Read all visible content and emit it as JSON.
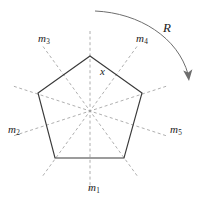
{
  "figure": {
    "shape": {
      "name": "regular-pentagon",
      "sides": 5,
      "center": {
        "x": 90,
        "y": 111
      },
      "circumradius": 55,
      "vertices": [
        {
          "x": 90,
          "y": 56
        },
        {
          "x": 142,
          "y": 93
        },
        {
          "x": 124,
          "y": 158
        },
        {
          "x": 55,
          "y": 158
        },
        {
          "x": 38,
          "y": 93
        }
      ],
      "edge_color": "#3a3a3a"
    },
    "center_label": {
      "text": "x",
      "x": 102,
      "y": 71
    },
    "mirror_line_color": "#9a9a9a",
    "mirror_lines": [
      {
        "id": "m1",
        "label": "m",
        "subscript": "1",
        "angle_deg": 90,
        "label_x": 89,
        "label_y": 186
      },
      {
        "id": "m2",
        "label": "m",
        "subscript": "2",
        "angle_deg": 162,
        "label_x": 9,
        "label_y": 128
      },
      {
        "id": "m3",
        "label": "m",
        "subscript": "3",
        "angle_deg": 234,
        "label_x": 38,
        "label_y": 37
      },
      {
        "id": "m4",
        "label": "m",
        "subscript": "4",
        "angle_deg": 306,
        "label_x": 135,
        "label_y": 37
      },
      {
        "id": "m5",
        "label": "m",
        "subscript": "5",
        "angle_deg": 18,
        "label_x": 170,
        "label_y": 128
      }
    ],
    "rotation": {
      "label": "R",
      "label_x": 163,
      "label_y": 27,
      "arc_color": "#6e6e6e",
      "arc_path": "M 95 11 C 140 13, 178 38, 188 74",
      "arrow_tip": {
        "x": 189,
        "y": 80
      }
    }
  }
}
